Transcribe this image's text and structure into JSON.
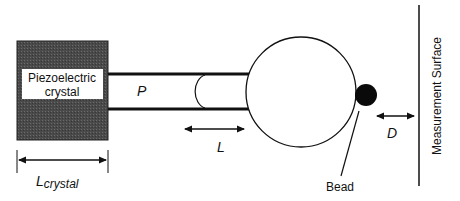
{
  "diagram": {
    "crystal": {
      "label_line1": "Piezoelectric",
      "label_line2": "crystal",
      "fill": "#4a4a4a"
    },
    "tube": {
      "pressure_label": "P"
    },
    "length_label": "L",
    "crystal_length_label": {
      "main": "L",
      "subscript": "crystal"
    },
    "bead_label": "Bead",
    "distance_label": "D",
    "surface_label": "Measurement Surface"
  }
}
